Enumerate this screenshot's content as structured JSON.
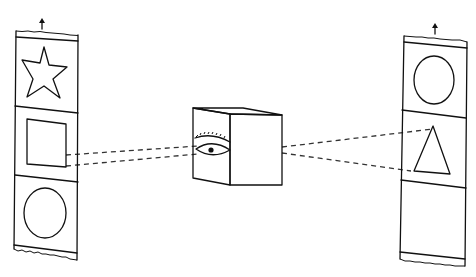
{
  "diagram": {
    "left_strip": {
      "direction": "up-arrow",
      "frames": [
        {
          "shape": "star"
        },
        {
          "shape": "square",
          "viewed": true
        },
        {
          "shape": "circle"
        }
      ]
    },
    "center": {
      "object": "cube",
      "feature": "eye"
    },
    "right_strip": {
      "direction": "up-arrow",
      "frames": [
        {
          "shape": "circle"
        },
        {
          "shape": "triangle",
          "viewed": true
        },
        {
          "shape": "empty"
        }
      ]
    },
    "sight_lines": {
      "style": "dashed",
      "color": "#333333"
    },
    "colors": {
      "ink": "#111111",
      "background": "#ffffff"
    }
  }
}
